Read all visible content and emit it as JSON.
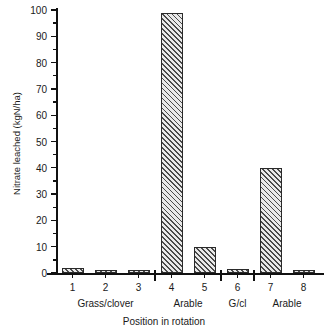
{
  "chart_data": {
    "type": "bar",
    "title": "",
    "subtitle": "",
    "xlabel": "Position in rotation",
    "ylabel": "Nitrate leached (kgN/ha)",
    "categories": [
      "1",
      "2",
      "3",
      "4",
      "5",
      "6",
      "7",
      "8"
    ],
    "values": [
      2,
      1,
      1,
      99,
      10,
      1.5,
      40,
      1
    ],
    "ylim": [
      0,
      100
    ],
    "yticks": [
      0,
      10,
      20,
      30,
      40,
      50,
      60,
      70,
      80,
      90,
      100
    ],
    "ytick_labels": [
      "0",
      "10",
      "20",
      "30",
      "40",
      "50",
      "60",
      "70",
      "80",
      "90",
      "100"
    ],
    "minor_ticks": true,
    "grid": false,
    "legend": null,
    "bar_style": "diagonal-hatch",
    "groups": [
      {
        "label": "Grass/clover",
        "positions": [
          "1",
          "2",
          "3"
        ]
      },
      {
        "label": "Arable",
        "positions": [
          "4",
          "5"
        ]
      },
      {
        "label": "G/cl",
        "positions": [
          "6"
        ]
      },
      {
        "label": "Arable",
        "positions": [
          "7",
          "8"
        ]
      }
    ],
    "group_separators_after": [
      "3",
      "5",
      "6"
    ],
    "colors": {
      "axis": "#111111",
      "bar_edge": "#2a2a2a",
      "bar_fill": "#e9e9e9",
      "hatch": "#4a4a4a",
      "background": "#ffffff"
    }
  }
}
